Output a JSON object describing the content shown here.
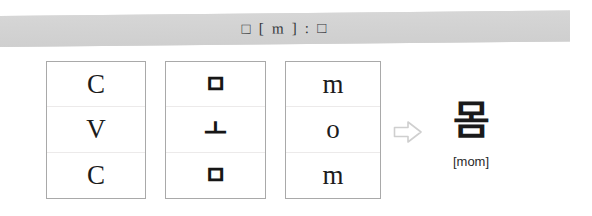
{
  "header": {
    "title": "□ [ m ] : □",
    "background_color": "#d3d3d3",
    "text_color": "#33363b"
  },
  "diagram": {
    "columns": [
      {
        "name": "structure-column",
        "cells": [
          {
            "label": "C"
          },
          {
            "label": "V"
          },
          {
            "label": "C"
          }
        ]
      },
      {
        "name": "jamo-column",
        "cells": [
          {
            "label": "ㅁ"
          },
          {
            "label": "ㅗ"
          },
          {
            "label": "ㅁ"
          }
        ]
      },
      {
        "name": "romanization-column",
        "cells": [
          {
            "label": "m"
          },
          {
            "label": "o"
          },
          {
            "label": "m"
          }
        ]
      }
    ],
    "arrow": {
      "icon": "right-arrow-icon",
      "glyph": "⇨",
      "color": "#d0d0d0"
    },
    "result": {
      "syllable": "몸",
      "transcription": "[mom]"
    }
  }
}
